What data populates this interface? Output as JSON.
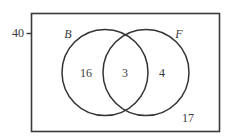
{
  "diagram": {
    "type": "venn",
    "universe": {
      "label": "40",
      "outside_count": "17"
    },
    "sets": [
      {
        "name": "B",
        "only_count": "16"
      },
      {
        "name": "F",
        "only_count": "4"
      }
    ],
    "intersection": {
      "sets": [
        "B",
        "F"
      ],
      "count": "3"
    },
    "colors": {
      "stroke": "#333333",
      "text": "#3a3a3a",
      "background": "#ffffff"
    }
  }
}
